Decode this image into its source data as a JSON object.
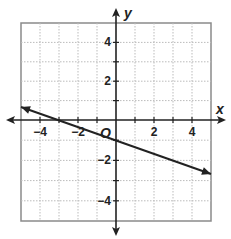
{
  "chart_data": {
    "type": "line",
    "title": "",
    "xlabel": "x",
    "ylabel": "y",
    "origin_label": "O",
    "xlim": [
      -5,
      5
    ],
    "ylim": [
      -5,
      5
    ],
    "grid": true,
    "grid_style": "dotted",
    "x_tick_labels": [
      "-4",
      "-2",
      "2",
      "4"
    ],
    "y_tick_labels": [
      "4",
      "2",
      "-2",
      "-4"
    ],
    "series": [
      {
        "name": "line",
        "equation": "y = -x/3 - 1",
        "slope": -0.3333,
        "y_intercept": -1,
        "x_intercept": -3,
        "x": [
          -5,
          5
        ],
        "y": [
          0.67,
          -2.67
        ],
        "arrows": "both"
      }
    ],
    "colors": {
      "line": "#222222",
      "grid": "#bbbbbb",
      "border": "#888888"
    }
  }
}
